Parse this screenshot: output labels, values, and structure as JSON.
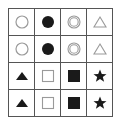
{
  "grid": {
    "rows": 4,
    "cols": 4,
    "cells": [
      [
        "circle-outline",
        "circle-filled",
        "double-circle",
        "triangle-outline"
      ],
      [
        "circle-outline",
        "circle-filled",
        "double-circle",
        "triangle-outline"
      ],
      [
        "triangle-filled",
        "square-outline",
        "square-filled",
        "star-filled"
      ],
      [
        "triangle-filled",
        "square-outline",
        "square-filled",
        "star-filled"
      ]
    ]
  },
  "colors": {
    "stroke_light": "#9a9a9a",
    "fill_dark": "#1a1a1a",
    "grid_line": "#555555"
  }
}
